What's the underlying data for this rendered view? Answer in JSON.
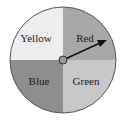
{
  "spinner": {
    "sections": [
      {
        "label": "Yellow",
        "color": "#eeeeee"
      },
      {
        "label": "Red",
        "color": "#a8a8a8"
      },
      {
        "label": "Blue",
        "color": "#8e8e8e"
      },
      {
        "label": "Green",
        "color": "#c8c8c8"
      }
    ],
    "arrow_points_to": "Red"
  }
}
